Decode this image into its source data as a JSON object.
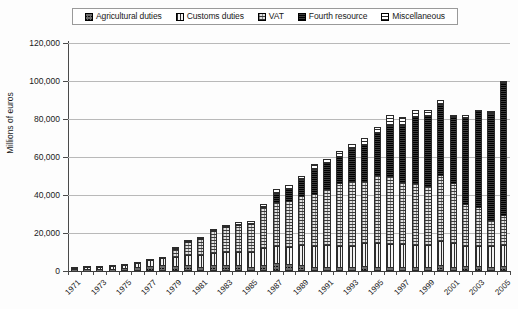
{
  "chart_data": {
    "type": "bar",
    "subtype": "stacked-column",
    "title": "",
    "xlabel": "",
    "ylabel": "Millions of euros",
    "ylim": [
      0,
      120000
    ],
    "ytick_step": 20000,
    "ytick_labels": [
      "0",
      "20,000",
      "40,000",
      "60,000",
      "80,000",
      "100,000",
      "120,000"
    ],
    "ytick_values": [
      0,
      20000,
      40000,
      60000,
      80000,
      100000,
      120000
    ],
    "grid": true,
    "legend_position": "top",
    "x": [
      1971,
      1972,
      1973,
      1974,
      1975,
      1976,
      1977,
      1978,
      1979,
      1980,
      1981,
      1982,
      1983,
      1984,
      1985,
      1986,
      1987,
      1988,
      1989,
      1990,
      1991,
      1992,
      1993,
      1994,
      1995,
      1996,
      1997,
      1998,
      1999,
      2000,
      2001,
      2002,
      2003,
      2004,
      2005
    ],
    "categories": [
      "1971",
      "1972",
      "1973",
      "1974",
      "1975",
      "1976",
      "1977",
      "1978",
      "1979",
      "1980",
      "1981",
      "1982",
      "1983",
      "1984",
      "1985",
      "1986",
      "1987",
      "1988",
      "1989",
      "1990",
      "1991",
      "1992",
      "1993",
      "1994",
      "1995",
      "1996",
      "1997",
      "1998",
      "1999",
      "2000",
      "2001",
      "2002",
      "2003",
      "2004",
      "2005"
    ],
    "xtick_labels_shown": [
      "1971",
      "1973",
      "1975",
      "1977",
      "1979",
      "1981",
      "1983",
      "1985",
      "1987",
      "1989",
      "1991",
      "1993",
      "1995",
      "1997",
      "1999",
      "2001",
      "2003",
      "2005"
    ],
    "series": [
      {
        "name": "Agricultural duties",
        "pattern": "pat-agri",
        "values": [
          700,
          750,
          480,
          330,
          590,
          1100,
          1800,
          2280,
          2010,
          2080,
          1260,
          2030,
          2300,
          2100,
          1120,
          2290,
          3100,
          2600,
          2400,
          1200,
          1200,
          1100,
          1200,
          1800,
          1200,
          1200,
          1100,
          1100,
          1200,
          1900,
          1100,
          1400,
          1400,
          1200,
          1350
        ]
      },
      {
        "name": "Customs duties",
        "pattern": "pat-customs",
        "values": [
          1400,
          1700,
          1900,
          2300,
          2600,
          3200,
          3700,
          4400,
          4900,
          5900,
          6400,
          6900,
          7000,
          7400,
          8300,
          8900,
          9300,
          9300,
          10300,
          11400,
          11500,
          11300,
          11200,
          12000,
          12500,
          12400,
          12100,
          11700,
          11700,
          13200,
          12800,
          11000,
          10800,
          11200,
          11400
        ]
      },
      {
        "name": "VAT",
        "pattern": "pat-vat",
        "values": [
          0,
          0,
          0,
          0,
          0,
          0,
          0,
          0,
          4800,
          7200,
          9200,
          12000,
          13600,
          14900,
          15200,
          22500,
          23800,
          25000,
          26700,
          27400,
          30300,
          33500,
          34500,
          33400,
          36300,
          36000,
          33300,
          33100,
          31200,
          35200,
          32200,
          22400,
          21300,
          13600,
          15800
        ]
      },
      {
        "name": "Fourth resource",
        "pattern": "pat-fourth",
        "values": [
          0,
          0,
          0,
          0,
          0,
          0,
          0,
          0,
          0,
          0,
          0,
          0,
          0,
          0,
          0,
          0,
          4900,
          6300,
          9000,
          13400,
          13800,
          14200,
          17800,
          19300,
          22800,
          27300,
          30400,
          35100,
          37500,
          37600,
          34900,
          45900,
          51200,
          57300,
          70600
        ]
      },
      {
        "name": "Miscellaneous",
        "pattern": "pat-misc",
        "values": [
          100,
          150,
          220,
          370,
          410,
          500,
          700,
          820,
          900,
          1100,
          1200,
          1200,
          1400,
          1500,
          1700,
          1600,
          1900,
          2300,
          1600,
          2700,
          2200,
          2900,
          2300,
          3500,
          3200,
          5100,
          4100,
          4000,
          3400,
          2100,
          1000,
          1300,
          100,
          700,
          850
        ]
      }
    ],
    "totals": [
      2200,
      2600,
      2600,
      3000,
      3600,
      4800,
      6200,
      7500,
      12610,
      16280,
      18060,
      22130,
      24300,
      25900,
      26320,
      35290,
      43000,
      45500,
      50000,
      56100,
      59000,
      63000,
      67000,
      70000,
      76000,
      82000,
      81000,
      85000,
      85000,
      90000,
      82000,
      82000,
      84800,
      84000,
      99000
    ]
  },
  "legend": {
    "items": [
      {
        "label": "Agricultural duties",
        "icon": "swatch-agricultural-duties"
      },
      {
        "label": "Customs duties",
        "icon": "swatch-customs-duties"
      },
      {
        "label": "VAT",
        "icon": "swatch-vat"
      },
      {
        "label": "Fourth resource",
        "icon": "swatch-fourth-resource"
      },
      {
        "label": "Miscellaneous",
        "icon": "swatch-miscellaneous"
      }
    ]
  },
  "colors": {
    "gridline": "#b9b9b9",
    "axis": "#3a3a3a",
    "background": "#fdfdfd",
    "bar_outline": "#2b2b2b"
  }
}
